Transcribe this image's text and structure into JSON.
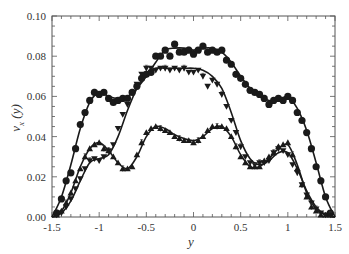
{
  "chart_data": {
    "type": "line",
    "title": "",
    "xlabel": "y",
    "ylabel": "v_x(y)",
    "xlim": [
      -1.5,
      1.5
    ],
    "ylim": [
      0.0,
      0.1
    ],
    "x_ticks": [
      -1.5,
      -1,
      -0.5,
      0,
      0.5,
      1,
      1.5
    ],
    "x_tick_labels": [
      "-1.5",
      "-1",
      "-0.5",
      "0",
      "0.5",
      "1",
      "1.5"
    ],
    "y_ticks": [
      0.0,
      0.02,
      0.04,
      0.06,
      0.08,
      0.1
    ],
    "y_tick_labels": [
      "0.00",
      "0.02",
      "0.04",
      "0.06",
      "0.08",
      "0.10"
    ],
    "grid": false,
    "legend": null,
    "series": [
      {
        "name": "circles",
        "marker": "circle",
        "x": [
          -1.45,
          -1.4,
          -1.35,
          -1.3,
          -1.25,
          -1.2,
          -1.15,
          -1.1,
          -1.05,
          -1.0,
          -0.95,
          -0.9,
          -0.85,
          -0.8,
          -0.75,
          -0.7,
          -0.65,
          -0.6,
          -0.55,
          -0.5,
          -0.45,
          -0.4,
          -0.35,
          -0.3,
          -0.25,
          -0.2,
          -0.15,
          -0.1,
          -0.05,
          0.0,
          0.05,
          0.1,
          0.15,
          0.2,
          0.25,
          0.3,
          0.35,
          0.4,
          0.45,
          0.5,
          0.55,
          0.6,
          0.65,
          0.7,
          0.75,
          0.8,
          0.85,
          0.9,
          0.95,
          1.0,
          1.05,
          1.1,
          1.15,
          1.2,
          1.25,
          1.3,
          1.35,
          1.4,
          1.45
        ],
        "values": [
          0.002,
          0.009,
          0.018,
          0.022,
          0.034,
          0.046,
          0.052,
          0.058,
          0.062,
          0.061,
          0.062,
          0.059,
          0.057,
          0.058,
          0.059,
          0.059,
          0.062,
          0.065,
          0.069,
          0.071,
          0.072,
          0.08,
          0.08,
          0.083,
          0.08,
          0.086,
          0.082,
          0.082,
          0.083,
          0.081,
          0.083,
          0.085,
          0.082,
          0.083,
          0.082,
          0.083,
          0.078,
          0.076,
          0.071,
          0.069,
          0.066,
          0.063,
          0.062,
          0.061,
          0.059,
          0.056,
          0.058,
          0.059,
          0.058,
          0.06,
          0.058,
          0.052,
          0.048,
          0.042,
          0.034,
          0.025,
          0.018,
          0.01,
          0.002
        ],
        "fit": [
          [
            -1.5,
            0.0
          ],
          [
            -1.4,
            0.01
          ],
          [
            -1.3,
            0.026
          ],
          [
            -1.2,
            0.044
          ],
          [
            -1.1,
            0.057
          ],
          [
            -1.0,
            0.062
          ],
          [
            -0.9,
            0.06
          ],
          [
            -0.8,
            0.059
          ],
          [
            -0.7,
            0.06
          ],
          [
            -0.6,
            0.064
          ],
          [
            -0.5,
            0.07
          ],
          [
            -0.4,
            0.077
          ],
          [
            -0.3,
            0.083
          ],
          [
            -0.2,
            0.084
          ],
          [
            -0.1,
            0.084
          ],
          [
            0.0,
            0.083
          ],
          [
            0.1,
            0.084
          ],
          [
            0.2,
            0.084
          ],
          [
            0.3,
            0.082
          ],
          [
            0.4,
            0.077
          ],
          [
            0.5,
            0.07
          ],
          [
            0.6,
            0.064
          ],
          [
            0.7,
            0.06
          ],
          [
            0.8,
            0.058
          ],
          [
            0.9,
            0.058
          ],
          [
            1.0,
            0.06
          ],
          [
            1.1,
            0.054
          ],
          [
            1.2,
            0.043
          ],
          [
            1.3,
            0.027
          ],
          [
            1.4,
            0.01
          ],
          [
            1.5,
            0.0
          ]
        ]
      },
      {
        "name": "down-triangles",
        "marker": "triangle-down",
        "x": [
          -1.45,
          -1.4,
          -1.35,
          -1.3,
          -1.25,
          -1.2,
          -1.15,
          -1.1,
          -1.05,
          -1.0,
          -0.95,
          -0.9,
          -0.85,
          -0.8,
          -0.75,
          -0.7,
          -0.65,
          -0.6,
          -0.55,
          -0.5,
          -0.45,
          -0.4,
          -0.35,
          -0.3,
          -0.25,
          -0.2,
          -0.15,
          -0.1,
          -0.05,
          0.0,
          0.05,
          0.1,
          0.15,
          0.2,
          0.25,
          0.3,
          0.35,
          0.4,
          0.45,
          0.5,
          0.55,
          0.6,
          0.65,
          0.7,
          0.75,
          0.8,
          0.85,
          0.9,
          0.95,
          1.0,
          1.05,
          1.1,
          1.15,
          1.2,
          1.25,
          1.3,
          1.35,
          1.4,
          1.45
        ],
        "values": [
          0.001,
          0.002,
          0.005,
          0.009,
          0.014,
          0.019,
          0.024,
          0.028,
          0.029,
          0.028,
          0.03,
          0.033,
          0.036,
          0.044,
          0.051,
          0.056,
          0.062,
          0.066,
          0.071,
          0.074,
          0.074,
          0.073,
          0.074,
          0.074,
          0.073,
          0.074,
          0.073,
          0.074,
          0.072,
          0.072,
          0.073,
          0.07,
          0.065,
          0.068,
          0.066,
          0.061,
          0.055,
          0.048,
          0.042,
          0.035,
          0.03,
          0.027,
          0.026,
          0.027,
          0.027,
          0.028,
          0.032,
          0.034,
          0.033,
          0.031,
          0.026,
          0.022,
          0.016,
          0.011,
          0.007,
          0.004,
          0.002,
          0.001,
          0.001
        ],
        "fit": [
          [
            -1.5,
            0.0
          ],
          [
            -1.4,
            0.002
          ],
          [
            -1.3,
            0.008
          ],
          [
            -1.2,
            0.018
          ],
          [
            -1.1,
            0.027
          ],
          [
            -1.0,
            0.029
          ],
          [
            -0.9,
            0.031
          ],
          [
            -0.8,
            0.04
          ],
          [
            -0.7,
            0.053
          ],
          [
            -0.6,
            0.064
          ],
          [
            -0.5,
            0.071
          ],
          [
            -0.4,
            0.074
          ],
          [
            -0.3,
            0.074
          ],
          [
            -0.2,
            0.074
          ],
          [
            -0.1,
            0.074
          ],
          [
            0.0,
            0.074
          ],
          [
            0.1,
            0.073
          ],
          [
            0.2,
            0.07
          ],
          [
            0.3,
            0.064
          ],
          [
            0.4,
            0.052
          ],
          [
            0.5,
            0.038
          ],
          [
            0.6,
            0.029
          ],
          [
            0.7,
            0.026
          ],
          [
            0.8,
            0.028
          ],
          [
            0.9,
            0.032
          ],
          [
            1.0,
            0.032
          ],
          [
            1.1,
            0.024
          ],
          [
            1.2,
            0.013
          ],
          [
            1.3,
            0.005
          ],
          [
            1.4,
            0.001
          ],
          [
            1.5,
            0.0
          ]
        ]
      },
      {
        "name": "up-triangles",
        "marker": "triangle-up",
        "x": [
          -1.45,
          -1.4,
          -1.35,
          -1.3,
          -1.25,
          -1.2,
          -1.15,
          -1.1,
          -1.05,
          -1.0,
          -0.95,
          -0.9,
          -0.85,
          -0.8,
          -0.75,
          -0.7,
          -0.65,
          -0.6,
          -0.55,
          -0.5,
          -0.45,
          -0.4,
          -0.35,
          -0.3,
          -0.25,
          -0.2,
          -0.15,
          -0.1,
          -0.05,
          0.0,
          0.05,
          0.1,
          0.15,
          0.2,
          0.25,
          0.3,
          0.35,
          0.4,
          0.45,
          0.5,
          0.55,
          0.6,
          0.65,
          0.7,
          0.75,
          0.8,
          0.85,
          0.9,
          0.95,
          1.0,
          1.05,
          1.1,
          1.15,
          1.2,
          1.25,
          1.3,
          1.35,
          1.4,
          1.45
        ],
        "values": [
          0.001,
          0.003,
          0.007,
          0.012,
          0.018,
          0.024,
          0.03,
          0.034,
          0.036,
          0.037,
          0.034,
          0.033,
          0.03,
          0.027,
          0.024,
          0.024,
          0.025,
          0.031,
          0.037,
          0.042,
          0.044,
          0.045,
          0.044,
          0.043,
          0.042,
          0.04,
          0.039,
          0.038,
          0.038,
          0.037,
          0.038,
          0.04,
          0.043,
          0.045,
          0.045,
          0.045,
          0.044,
          0.04,
          0.035,
          0.03,
          0.027,
          0.025,
          0.025,
          0.025,
          0.028,
          0.03,
          0.032,
          0.035,
          0.036,
          0.037,
          0.031,
          0.024,
          0.016,
          0.01,
          0.005,
          0.003,
          0.001,
          0.001,
          0.001
        ],
        "fit": [
          [
            -1.5,
            0.0
          ],
          [
            -1.4,
            0.003
          ],
          [
            -1.3,
            0.012
          ],
          [
            -1.2,
            0.025
          ],
          [
            -1.1,
            0.034
          ],
          [
            -1.0,
            0.037
          ],
          [
            -0.9,
            0.033
          ],
          [
            -0.8,
            0.027
          ],
          [
            -0.7,
            0.024
          ],
          [
            -0.6,
            0.03
          ],
          [
            -0.5,
            0.04
          ],
          [
            -0.4,
            0.045
          ],
          [
            -0.3,
            0.044
          ],
          [
            -0.2,
            0.041
          ],
          [
            -0.1,
            0.039
          ],
          [
            0.0,
            0.038
          ],
          [
            0.1,
            0.04
          ],
          [
            0.2,
            0.044
          ],
          [
            0.3,
            0.045
          ],
          [
            0.4,
            0.04
          ],
          [
            0.5,
            0.031
          ],
          [
            0.6,
            0.025
          ],
          [
            0.7,
            0.025
          ],
          [
            0.8,
            0.029
          ],
          [
            0.9,
            0.034
          ],
          [
            1.0,
            0.036
          ],
          [
            1.1,
            0.026
          ],
          [
            1.2,
            0.012
          ],
          [
            1.3,
            0.004
          ],
          [
            1.4,
            0.001
          ],
          [
            1.5,
            0.0
          ]
        ]
      }
    ]
  },
  "colors": {
    "ink": "#1a1a1a",
    "axis": "#555555",
    "background": "#ffffff"
  }
}
